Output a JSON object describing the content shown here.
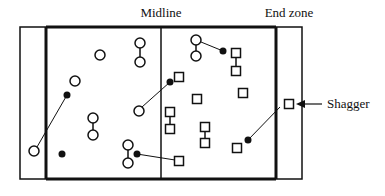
{
  "labels": {
    "midline": "Midline",
    "end_zone": "End zone",
    "shagger": "Shagger"
  },
  "colors": {
    "stroke": "#111111",
    "background": "#ffffff"
  },
  "field": {
    "outer": {
      "x": 20,
      "y": 27,
      "w": 282,
      "h": 152
    },
    "left_end_zone_line_x": 46,
    "right_end_zone_line_x": 276,
    "midline_x": 161
  },
  "players_circle": [
    {
      "x": 34,
      "y": 151
    },
    {
      "x": 75,
      "y": 81
    },
    {
      "x": 100,
      "y": 55
    },
    {
      "x": 140,
      "y": 43
    },
    {
      "x": 140,
      "y": 62
    },
    {
      "x": 93,
      "y": 118
    },
    {
      "x": 93,
      "y": 135
    },
    {
      "x": 139,
      "y": 111
    },
    {
      "x": 128,
      "y": 145
    },
    {
      "x": 128,
      "y": 163
    },
    {
      "x": 196,
      "y": 40
    },
    {
      "x": 196,
      "y": 56
    }
  ],
  "circle_links": [
    [
      3,
      4
    ],
    [
      5,
      6
    ],
    [
      8,
      9
    ],
    [
      10,
      11
    ]
  ],
  "players_square": [
    {
      "x": 179,
      "y": 77
    },
    {
      "x": 236,
      "y": 53
    },
    {
      "x": 236,
      "y": 71
    },
    {
      "x": 197,
      "y": 99
    },
    {
      "x": 243,
      "y": 93
    },
    {
      "x": 170,
      "y": 112
    },
    {
      "x": 170,
      "y": 129
    },
    {
      "x": 205,
      "y": 127
    },
    {
      "x": 205,
      "y": 143
    },
    {
      "x": 237,
      "y": 148
    },
    {
      "x": 179,
      "y": 161
    },
    {
      "x": 289,
      "y": 104
    }
  ],
  "square_links": [
    [
      1,
      2
    ],
    [
      5,
      6
    ],
    [
      7,
      8
    ]
  ],
  "balls": [
    {
      "x": 67,
      "y": 95
    },
    {
      "x": 62,
      "y": 154
    },
    {
      "x": 170,
      "y": 82
    },
    {
      "x": 223,
      "y": 51
    },
    {
      "x": 137,
      "y": 154
    },
    {
      "x": 248,
      "y": 140
    }
  ],
  "throw_lines": [
    {
      "x1": 67,
      "y1": 95,
      "x2": 37,
      "y2": 147
    },
    {
      "x1": 170,
      "y1": 82,
      "x2": 142,
      "y2": 107
    },
    {
      "x1": 201,
      "y1": 42,
      "x2": 223,
      "y2": 51
    },
    {
      "x1": 137,
      "y1": 154,
      "x2": 175,
      "y2": 160
    },
    {
      "x1": 248,
      "y1": 140,
      "x2": 280,
      "y2": 107
    }
  ],
  "shagger_arrow": {
    "x1": 322,
    "y1": 104,
    "x2": 296,
    "y2": 104
  },
  "label_pos": {
    "midline": {
      "x": 161,
      "y": 17
    },
    "end_zone": {
      "x": 289,
      "y": 17
    },
    "shagger": {
      "x": 327,
      "y": 108
    }
  }
}
